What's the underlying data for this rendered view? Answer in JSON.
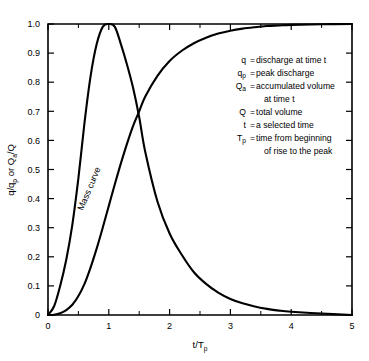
{
  "figure": {
    "background": "#ffffff",
    "ink": "#000000"
  },
  "chart_data": {
    "type": "line",
    "title": "",
    "xlabel": "t/T",
    "xlabel_sub": "p",
    "ylabel": "q/q",
    "ylabel_sub1": "p",
    "ylabel_mid": " or Q",
    "ylabel_sub2": "a",
    "ylabel_end": "/Q",
    "xlim": [
      0,
      5
    ],
    "ylim": [
      0,
      1.0
    ],
    "grid": false,
    "legend_position": "inside-right",
    "x_ticks_major": [
      0,
      1,
      2,
      3,
      4,
      5
    ],
    "x_ticks_major_labels": [
      "0",
      "1",
      "2",
      "3",
      "4",
      "5"
    ],
    "x_ticks_minor": [
      0.5,
      1.5,
      2.5,
      3.5,
      4.5
    ],
    "y_ticks_major": [
      0,
      0.1,
      0.2,
      0.3,
      0.4,
      0.5,
      0.6,
      0.7,
      0.8,
      0.9,
      1.0
    ],
    "y_ticks_major_labels": [
      "0",
      "0.1",
      "0.2",
      "0.3",
      "0.4",
      "0.5",
      "0.6",
      "0.7",
      "0.8",
      "0.9",
      "1.0"
    ],
    "series": [
      {
        "name": "Dimensionless unit hydrograph",
        "x": [
          0,
          0.1,
          0.2,
          0.3,
          0.4,
          0.5,
          0.6,
          0.7,
          0.8,
          0.9,
          1.0,
          1.1,
          1.2,
          1.3,
          1.4,
          1.5,
          1.6,
          1.8,
          2.0,
          2.2,
          2.4,
          2.6,
          2.8,
          3.0,
          3.2,
          3.4,
          3.6,
          3.8,
          4.0,
          4.5,
          5.0
        ],
        "values": [
          0.0,
          0.03,
          0.1,
          0.19,
          0.31,
          0.47,
          0.66,
          0.82,
          0.93,
          0.99,
          1.0,
          0.99,
          0.93,
          0.86,
          0.78,
          0.68,
          0.56,
          0.39,
          0.28,
          0.207,
          0.147,
          0.107,
          0.077,
          0.055,
          0.04,
          0.029,
          0.021,
          0.015,
          0.011,
          0.005,
          0.0
        ]
      },
      {
        "name": "Mass curve",
        "x": [
          0,
          0.1,
          0.2,
          0.3,
          0.4,
          0.5,
          0.6,
          0.7,
          0.8,
          0.9,
          1.0,
          1.1,
          1.2,
          1.3,
          1.4,
          1.5,
          1.6,
          1.8,
          2.0,
          2.2,
          2.4,
          2.6,
          2.8,
          3.0,
          3.2,
          3.4,
          3.6,
          3.8,
          4.0,
          4.5,
          5.0
        ],
        "values": [
          0.0,
          0.001,
          0.006,
          0.017,
          0.035,
          0.065,
          0.107,
          0.163,
          0.228,
          0.3,
          0.375,
          0.45,
          0.522,
          0.589,
          0.65,
          0.7,
          0.751,
          0.822,
          0.873,
          0.908,
          0.934,
          0.953,
          0.967,
          0.977,
          0.984,
          0.989,
          0.993,
          0.995,
          0.997,
          0.999,
          1.0
        ]
      }
    ],
    "annotations": [
      {
        "name": "mass-curve-label",
        "text": "Mass curve",
        "x": 0.72,
        "y": 0.43,
        "rotation": -67
      }
    ]
  },
  "legend": {
    "entries": [
      {
        "symbol": "q",
        "sub": "",
        "eq": "=",
        "text": "discharge at time t",
        "text2": ""
      },
      {
        "symbol": "q",
        "sub": "p",
        "eq": "=",
        "text": "peak discharge",
        "text2": ""
      },
      {
        "symbol": "Q",
        "sub": "a",
        "eq": "=",
        "text": "accumulated volume",
        "text2": "at time t"
      },
      {
        "symbol": "Q",
        "sub": "",
        "eq": "=",
        "text": "total volume",
        "text2": ""
      },
      {
        "symbol": "t",
        "sub": "",
        "eq": "=",
        "text": "a selected time",
        "text2": ""
      },
      {
        "symbol": "T",
        "sub": "p",
        "eq": "=",
        "text": "time from beginning",
        "text2": "of rise to the peak"
      }
    ]
  }
}
